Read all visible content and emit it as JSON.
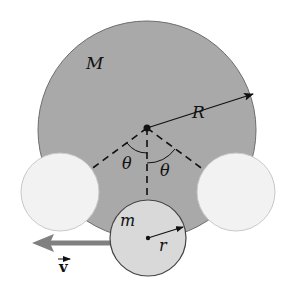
{
  "diagram": {
    "type": "physics-figure",
    "labels": {
      "large_mass": "M",
      "large_radius": "R",
      "small_mass": "m",
      "small_radius": "r",
      "angle_left": "θ",
      "angle_right": "θ",
      "velocity": "v"
    },
    "colors": {
      "large_sphere_fill": "#a9a9a9",
      "large_sphere_stroke": "#6e6e6e",
      "small_sphere_fill": "#d9d9d9",
      "ghost_sphere_fill": "#f2f2f2",
      "ghost_sphere_stroke": "#c8c8c8",
      "velocity_arrow": "#808080",
      "line": "#111111"
    }
  }
}
